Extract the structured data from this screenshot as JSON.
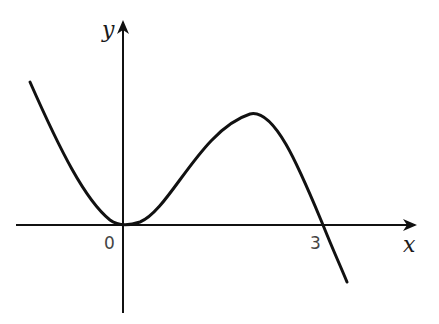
{
  "diagram": {
    "type": "function-graph",
    "axes": {
      "x_label": "x",
      "y_label": "y",
      "origin_label": "0"
    },
    "marked_points": [
      {
        "label": "0",
        "x": 0,
        "y": 0,
        "kind": "tangent-root"
      },
      {
        "label": "3",
        "x": 3,
        "y": 0,
        "kind": "crossing-root"
      }
    ],
    "curve": {
      "shape": "y = -k·x²(x−3)",
      "local_min_x": 0,
      "local_max_x": 2,
      "stroke_color": "#111111"
    },
    "colors": {
      "background": "#ffffff",
      "axis": "#111111",
      "label": "#444444"
    }
  }
}
